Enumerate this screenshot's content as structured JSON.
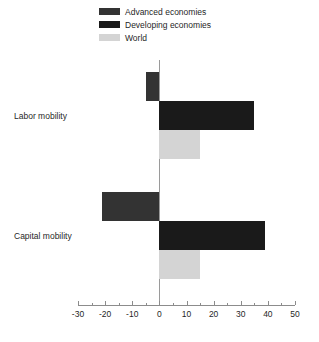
{
  "chart_data": {
    "type": "bar",
    "orientation": "horizontal",
    "title": "",
    "subtitle": "",
    "xlabel": "",
    "ylabel": "",
    "categories": [
      "Labor mobility",
      "Capital mobility"
    ],
    "series": [
      {
        "name": "Advanced economies",
        "color": "#333333",
        "values": [
          -5,
          -21
        ]
      },
      {
        "name": "Developing economies",
        "color": "#1a1a1a",
        "values": [
          35,
          39
        ]
      },
      {
        "name": "World",
        "color": "#d4d4d4",
        "values": [
          15,
          15
        ]
      }
    ],
    "xlim": [
      -30,
      50
    ],
    "xticks": [
      -30,
      -20,
      -10,
      0,
      10,
      20,
      30,
      40,
      50
    ],
    "xtick_labels": [
      "-30",
      "-20",
      "-10",
      "0",
      "10",
      "20",
      "30",
      "40",
      "50"
    ],
    "minor_tick_step": 5,
    "grid": false,
    "legend_position": "top",
    "zero_line": true
  },
  "legend": {
    "items": [
      {
        "label": "Advanced economies",
        "swatch_name": "legend-swatch-advanced-economies"
      },
      {
        "label": "Developing economies",
        "swatch_name": "legend-swatch-developing-economies"
      },
      {
        "label": "World",
        "swatch_name": "legend-swatch-world"
      }
    ]
  },
  "colors": {
    "advanced": "#333333",
    "developing": "#1a1a1a",
    "world": "#d4d4d4",
    "axis": "#8c8c8c",
    "zero_line": "#9a9a9a",
    "text": "#1f1f1f",
    "background": "#ffffff"
  }
}
